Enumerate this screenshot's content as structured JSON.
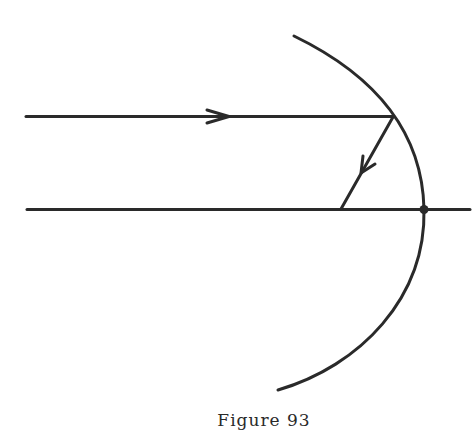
{
  "figure": {
    "caption": "Figure 93",
    "stroke_color": "#2a2a2a",
    "background": "#ffffff",
    "elements": {
      "incident_ray": {
        "from": [
          26,
          116
        ],
        "to": [
          393,
          116
        ],
        "arrow_at": [
          228,
          116
        ],
        "direction": "right"
      },
      "reflected_ray": {
        "from": [
          393,
          116
        ],
        "to": [
          341,
          209
        ],
        "arrow_at": [
          363,
          170
        ],
        "direction": "down-left"
      },
      "principal_axis": {
        "from": [
          27,
          209
        ],
        "to": [
          470,
          209
        ]
      },
      "mirror": {
        "type": "concave arc",
        "top": [
          294,
          36
        ],
        "vertex": [
          424,
          209
        ],
        "bottom": [
          278,
          390
        ]
      },
      "vertex_point": {
        "at": [
          424,
          209
        ]
      }
    }
  }
}
